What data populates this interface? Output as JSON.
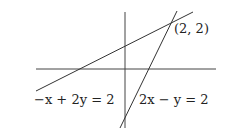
{
  "diagram": {
    "axes": {
      "x_axis": "horizontal",
      "y_axis": "vertical"
    },
    "lines": [
      {
        "equation": "−x + 2y = 2",
        "label": "−x + 2y = 2"
      },
      {
        "equation": "2x − y = 2",
        "label": "2x − y = 2"
      }
    ],
    "intersection": {
      "label": "(2, 2)",
      "x": 2,
      "y": 2
    },
    "colors": {
      "stroke": "#333333",
      "background": "#ffffff"
    }
  }
}
